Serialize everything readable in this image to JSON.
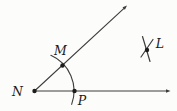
{
  "figure": {
    "width": 177,
    "height": 111,
    "background": "#fcfcfb",
    "stroke_color": "#3d3d3d",
    "dot_color": "#1c1c1c",
    "label_color": "#1a1a1a",
    "rays": [
      {
        "name": "ray-horizontal",
        "from": [
          34.5,
          91
        ],
        "to": [
          170.5,
          91
        ]
      },
      {
        "name": "ray-diagonal",
        "from": [
          34.5,
          91
        ],
        "to": [
          127,
          5.5
        ]
      }
    ],
    "arc": {
      "name": "compass-arc-MP",
      "cx": 35,
      "cy": 91,
      "r": 39,
      "start_deg": -20,
      "end_deg": 66
    },
    "tick_marks": [
      {
        "name": "l-cross-mark-1",
        "from": [
          142.5,
          36.5
        ],
        "to": [
          150,
          61.5
        ]
      },
      {
        "name": "l-cross-mark-2",
        "from": [
          153,
          39.5
        ],
        "to": [
          141,
          57
        ]
      }
    ],
    "points": [
      {
        "id": "N",
        "dot": [
          34.5,
          91
        ],
        "label": {
          "text": "N",
          "x": 17.5,
          "y": 95.5
        }
      },
      {
        "id": "M",
        "dot": [
          62.5,
          65.5
        ],
        "label": {
          "text": "M",
          "x": 60.5,
          "y": 55
        }
      },
      {
        "id": "P",
        "dot": [
          74.5,
          91
        ],
        "label": {
          "text": "P",
          "x": 82,
          "y": 105
        }
      },
      {
        "id": "L",
        "dot": [
          147,
          50
        ],
        "label": {
          "text": "L",
          "x": 160,
          "y": 48
        }
      }
    ]
  }
}
